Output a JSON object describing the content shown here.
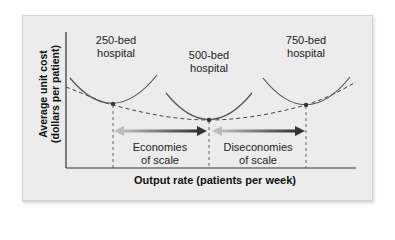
{
  "diagram": {
    "y_axis_label": [
      "Average unit cost",
      "(dollars per patient)"
    ],
    "x_axis_label": "Output rate (patients per week)",
    "curves": [
      {
        "label_line1": "250-bed",
        "label_line2": "hospital"
      },
      {
        "label_line1": "500-bed",
        "label_line2": "hospital"
      },
      {
        "label_line1": "750-bed",
        "label_line2": "hospital"
      }
    ],
    "regions": [
      {
        "line1": "Economies",
        "line2": "of scale"
      },
      {
        "line1": "Diseconomies",
        "line2": "of scale"
      }
    ],
    "colors": {
      "panel_bg": "#ececec",
      "curve": "#555555",
      "arrow_dark": "#3a3a3a",
      "arrow_light": "#b8b8b8"
    }
  }
}
